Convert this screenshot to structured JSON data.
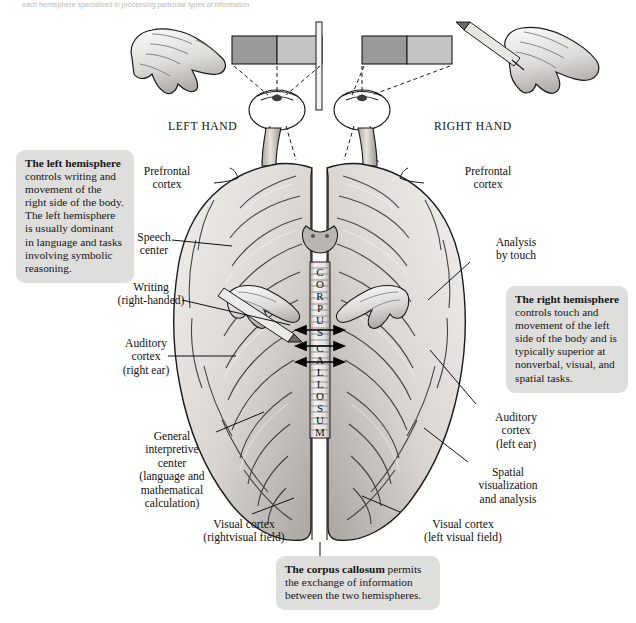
{
  "figure": {
    "top_caption": "each hemisphere specialized in processing particular types of information",
    "hand_labels": {
      "left": "LEFT HAND",
      "right": "RIGHT HAND"
    },
    "corpus_callosum_vertical": "CORPUSCALLOSUM",
    "corpus_callosum_letters": [
      "C",
      "O",
      "R",
      "P",
      "U",
      "S",
      "C",
      "A",
      "L",
      "L",
      "O",
      "S",
      "U",
      "M"
    ]
  },
  "callouts": {
    "left": {
      "title": "The left hemisphere",
      "body": " controls writing and movement of the right side of the body. The left hemisphere is usually dominant in language and tasks involving symbolic reasoning."
    },
    "right": {
      "title": "The right hemisphere",
      "body": " controls touch and movement of the left side of the body and is typically superior at nonverbal, visual, and spatial tasks."
    },
    "bottom": {
      "title": "The corpus callosum",
      "body": " permits the exchange of information between the two hemispheres."
    }
  },
  "labels_left": [
    {
      "id": "prefrontal-cortex-left",
      "lines": "Prefrontal\ncortex"
    },
    {
      "id": "speech-center",
      "lines": "Speech\ncenter"
    },
    {
      "id": "writing-right-handed",
      "lines": "Writing\n(right-handed)"
    },
    {
      "id": "auditory-cortex-right-ear",
      "lines": "Auditory\ncortex\n(right ear)"
    },
    {
      "id": "general-interpretive-center",
      "lines": "General\ninterpretive\ncenter\n(language and\nmathematical\ncalculation)"
    },
    {
      "id": "visual-cortex-right-visual-field",
      "lines": "Visual cortex\n(rightvisual field)"
    }
  ],
  "labels_right": [
    {
      "id": "prefrontal-cortex-right",
      "lines": "Prefrontal\ncortex"
    },
    {
      "id": "analysis-by-touch",
      "lines": "Analysis\nby touch"
    },
    {
      "id": "auditory-cortex-left-ear",
      "lines": "Auditory\ncortex\n(left ear)"
    },
    {
      "id": "spatial-visualization-and-analysis",
      "lines": "Spatial\nvisualization\nand analysis"
    },
    {
      "id": "visual-cortex-left-visual-field",
      "lines": "Visual cortex\n(left visual field)"
    }
  ],
  "colors": {
    "callout_bg": "#dededd",
    "brain_light": "#e9e7e4",
    "brain_mid": "#c9c6c2",
    "brain_dark": "#8f8c88",
    "visual_field_dark": "#9a9a9a",
    "visual_field_light": "#c4c4c4",
    "outline": "#1a1a1a"
  }
}
